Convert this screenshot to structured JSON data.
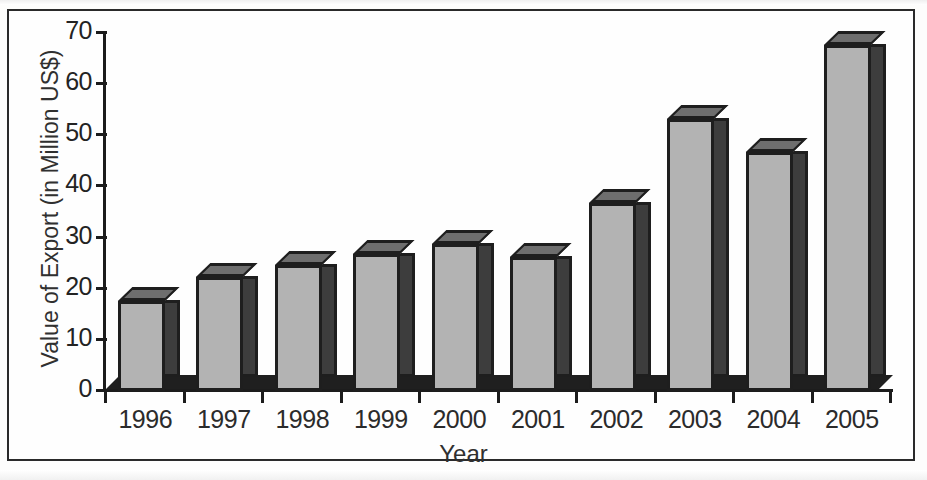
{
  "chart_data": {
    "type": "bar",
    "title": "",
    "xlabel": "Year",
    "ylabel": "Value of Export (in Million US$)",
    "categories": [
      "1996",
      "1997",
      "1998",
      "1999",
      "2000",
      "2001",
      "2002",
      "2003",
      "2004",
      "2005"
    ],
    "values": [
      17.5,
      22,
      24.5,
      26.5,
      28.5,
      26,
      36.5,
      53,
      46.5,
      67.5
    ],
    "series": [
      {
        "name": "Value of Export",
        "values": [
          17.5,
          22,
          24.5,
          26.5,
          28.5,
          26,
          36.5,
          53,
          46.5,
          67.5
        ]
      }
    ],
    "ylim": [
      0,
      70
    ],
    "y_ticks": [
      0,
      10,
      20,
      30,
      40,
      50,
      60,
      70
    ],
    "y_tick_labels": [
      "0",
      "10",
      "20",
      "30",
      "40",
      "50",
      "60",
      "70"
    ],
    "grid": false,
    "legend": false,
    "style_3d": true,
    "colors": {
      "bar_face": "#b3b3b3",
      "bar_side": "#3d3d3d",
      "bar_top": "#6e6e6e",
      "axis": "#1c1c1c",
      "text": "#2b2b2b",
      "background": "#ffffff",
      "frame": "#2a2a2a"
    }
  }
}
